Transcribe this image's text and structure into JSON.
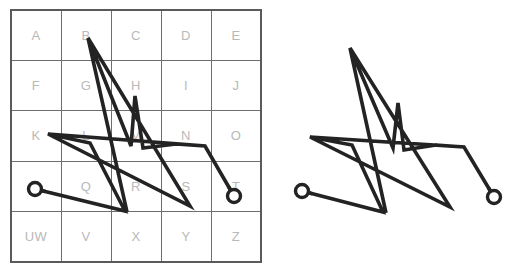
{
  "figure": {
    "background_color": "#ffffff",
    "stroke_color": "#232323",
    "grid_line_color": "#6e6e6e",
    "grid_frame_color": "#5a5a5a",
    "label_color": "#b9b9b9"
  },
  "left_panel": {
    "name": "letter-grid-panel",
    "grid": {
      "x": 11,
      "y": 10,
      "width": 250,
      "height": 252,
      "columns": 5,
      "rows": 5,
      "rows_labels": [
        [
          "A",
          "B",
          "C",
          "D",
          "E"
        ],
        [
          "F",
          "G",
          "H",
          "I",
          "J"
        ],
        [
          "K",
          "L",
          "M",
          "N",
          "O"
        ],
        [
          "P",
          "Q",
          "R",
          "S",
          "T"
        ],
        [
          "UW",
          "V",
          "X",
          "Y",
          "Z"
        ]
      ]
    },
    "stroke": {
      "name": "gesture-stroke-left",
      "start_marker": {
        "x": 35,
        "y": 189,
        "radius": 6.5
      },
      "end_marker": {
        "x": 234,
        "y": 196,
        "radius": 6.5
      },
      "points": [
        [
          35,
          189
        ],
        [
          125,
          211
        ],
        [
          90,
          143
        ],
        [
          48,
          134
        ],
        [
          205,
          146
        ],
        [
          176,
          144
        ],
        [
          143,
          148
        ],
        [
          135,
          96
        ],
        [
          131,
          146
        ],
        [
          88,
          38
        ],
        [
          127,
          212
        ],
        [
          88,
          38
        ],
        [
          190,
          206
        ],
        [
          48,
          134
        ],
        [
          205,
          146
        ],
        [
          234,
          196
        ]
      ],
      "segments_count": 15
    }
  },
  "right_panel": {
    "name": "gesture-only-panel",
    "stroke": {
      "name": "gesture-stroke-right",
      "start_marker": {
        "x": 302,
        "y": 191,
        "radius": 6.5
      },
      "end_marker": {
        "x": 494,
        "y": 197,
        "radius": 6.5
      },
      "points": [
        [
          302,
          191
        ],
        [
          383,
          212
        ],
        [
          352,
          145
        ],
        [
          310,
          137
        ],
        [
          464,
          147
        ],
        [
          436,
          145
        ],
        [
          404,
          150
        ],
        [
          398,
          103
        ],
        [
          393,
          148
        ],
        [
          350,
          48
        ],
        [
          386,
          213
        ],
        [
          350,
          48
        ],
        [
          450,
          207
        ],
        [
          310,
          137
        ],
        [
          464,
          147
        ],
        [
          494,
          197
        ]
      ],
      "segments_count": 15
    }
  },
  "caption": {
    "text": ""
  }
}
